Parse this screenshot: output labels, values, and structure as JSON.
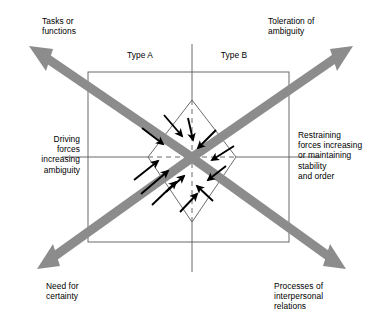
{
  "diagram": {
    "colors": {
      "arrow_gray": "#8c8c8c",
      "line_black": "#000000",
      "thin_line": "#555555",
      "background": "#ffffff"
    },
    "axis_labels": {
      "top_left": "Tasks or\nfunctions",
      "top_right": "Toleration of\nambiguity",
      "left": "Driving\nforces\nincreasing\nambiguity",
      "right": "Restraining\nforces increasing\nor maintaining\nstability\nand order",
      "bottom_left": "Need for\ncertainty",
      "bottom_right": "Processes of\ninterpersonal\nrelations"
    },
    "quadrant_labels": {
      "left": "Type A",
      "right": "Type B"
    },
    "shapes": {
      "outer_square": "square",
      "inner_diamond": "rotated-square",
      "vertical_axis": "solid-line",
      "horizontal_axis": "solid-line",
      "inner_axes": "dashed-line"
    },
    "gray_arrows": [
      {
        "name": "arrow-to-tasks-or-functions",
        "direction": "up-left"
      },
      {
        "name": "arrow-to-toleration-of-ambiguity",
        "direction": "up-right"
      },
      {
        "name": "arrow-to-need-for-certainty",
        "direction": "down-left"
      },
      {
        "name": "arrow-to-processes-of-interpersonal-relations",
        "direction": "down-right"
      }
    ],
    "black_arrows": {
      "count": 12,
      "direction": "inward toward center",
      "description": "Twelve short black arrows converging on the centre point"
    }
  }
}
